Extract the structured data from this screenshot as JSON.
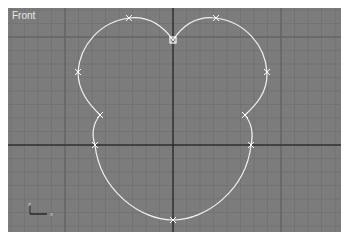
{
  "viewport": {
    "label": "Front",
    "background": "#7c7c7c",
    "grid_color": "#737373",
    "major_grid_color": "#5e5e5e",
    "axis_color": "#1a1a1a",
    "spline_color": "#f2f2f2",
    "vertex_color": "#ffffff"
  },
  "spline": {
    "name": "heart-like closed spline",
    "vertex_count": 10,
    "closed": true
  },
  "gizmo": {
    "x_label": "x",
    "z_label": "z"
  }
}
